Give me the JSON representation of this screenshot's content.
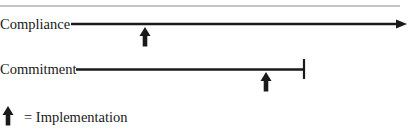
{
  "diagram": {
    "rows": [
      {
        "label": "Compliance",
        "line_end": "arrow",
        "implementation_marker": true
      },
      {
        "label": "Commitment",
        "line_end": "bar",
        "implementation_marker": true
      }
    ],
    "legend": {
      "icon": "up-arrow-icon",
      "text": "= Implementation"
    },
    "colors": {
      "line": "#1a1a1a",
      "top_rule": "#8a8a8a",
      "background": "#ffffff"
    }
  }
}
